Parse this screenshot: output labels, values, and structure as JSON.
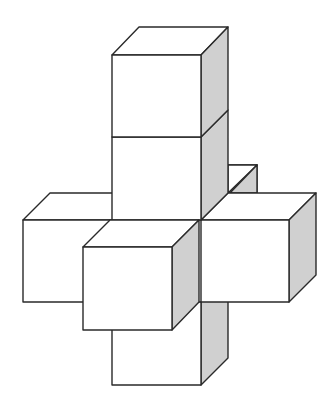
{
  "figure": {
    "cube_count_visible": 7,
    "colors": {
      "background": "#ffffff",
      "outline": "#2a2a2a",
      "front_face": "#ffffff",
      "top_face": "#ffffff",
      "side_face": "#d0d0d0"
    },
    "cubes": [
      {
        "id": "back-cube",
        "position": "behind center"
      },
      {
        "id": "top-cube",
        "position": "top of column"
      },
      {
        "id": "upper-cube",
        "position": "second in column"
      },
      {
        "id": "left-cube",
        "position": "left arm"
      },
      {
        "id": "right-cube",
        "position": "right arm"
      },
      {
        "id": "bottom-cube",
        "position": "bottom of column"
      },
      {
        "id": "front-cube",
        "position": "front arm"
      }
    ]
  }
}
